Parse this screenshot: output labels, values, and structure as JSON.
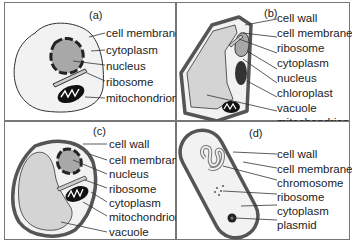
{
  "panels": [
    {
      "id": "a",
      "tag": "(a)",
      "labels": [
        "cell membrane",
        "cytoplasm",
        "nucleus",
        "ribosome",
        "mitochondrion"
      ]
    },
    {
      "id": "b",
      "tag": "(b)",
      "labels": [
        "cell wall",
        "cell membrane",
        "ribosome",
        "cytoplasm",
        "nucleus",
        "chloroplast",
        "vacuole",
        "mitochondrion"
      ]
    },
    {
      "id": "c",
      "tag": "(c)",
      "labels": [
        "cell wall",
        "cell membrane",
        "nucleus",
        "ribosome",
        "cytoplasm",
        "mitochondrion",
        "vacuole"
      ]
    },
    {
      "id": "d",
      "tag": "(d)",
      "labels": [
        "cell wall",
        "cell membrane",
        "chromosome",
        "ribosome",
        "cytoplasm",
        "plasmid"
      ]
    }
  ],
  "colors": {
    "outline": "#333333",
    "cytoplasm": "#f2f2f2",
    "nucleus": "#a8a8a8",
    "vacuole": "#d4d4d4",
    "wall": "#555555",
    "frame": "#777777"
  }
}
